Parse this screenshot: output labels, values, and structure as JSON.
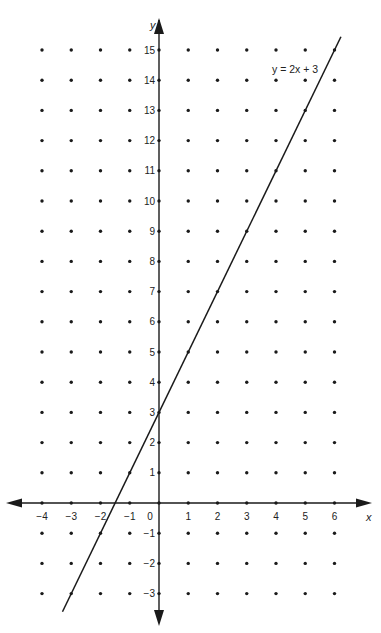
{
  "chart_data": {
    "type": "line",
    "title": "",
    "xlabel": "x",
    "ylabel": "y",
    "xlim": [
      -4,
      6
    ],
    "ylim": [
      -3,
      15
    ],
    "x_ticks": [
      -4,
      -3,
      -2,
      -1,
      0,
      1,
      2,
      3,
      4,
      5,
      6
    ],
    "y_ticks": [
      -3,
      -2,
      -1,
      1,
      2,
      3,
      4,
      5,
      6,
      7,
      8,
      9,
      10,
      11,
      12,
      13,
      14,
      15
    ],
    "grid": "dot lattice at integer points",
    "series": [
      {
        "name": "y = 2x + 3",
        "equation": "y = 2x + 3",
        "slope": 2,
        "intercept": 3,
        "x": [
          -3,
          -2,
          -1,
          0,
          1,
          2,
          3,
          4,
          5,
          6
        ],
        "values": [
          -3,
          -1,
          1,
          3,
          5,
          7,
          9,
          11,
          13,
          15
        ]
      }
    ],
    "annotations": [
      {
        "text": "y = 2x + 3",
        "x": 5.2,
        "y": 14.3
      }
    ],
    "origin_label": "0"
  },
  "colors": {
    "line": "#1a1a1a",
    "axis": "#1a1a1a",
    "dot": "#1a1a1a",
    "background": "#ffffff"
  }
}
